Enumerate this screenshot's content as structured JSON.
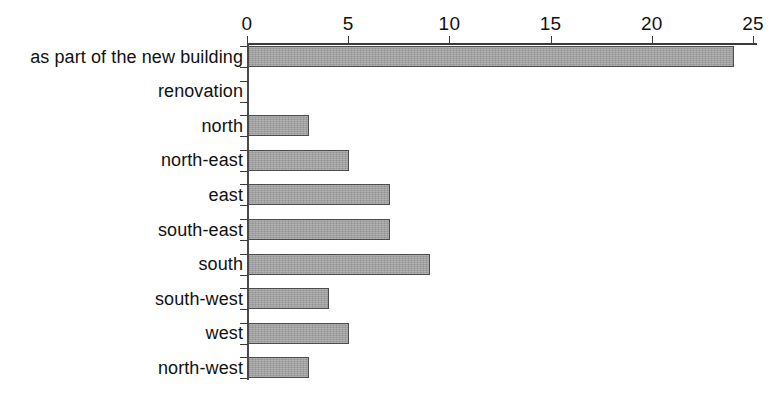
{
  "chart_data": {
    "type": "bar",
    "orientation": "horizontal",
    "title": "",
    "subtitle": "",
    "xlabel": "",
    "ylabel": "",
    "xlim": [
      0,
      25
    ],
    "xticks": [
      0,
      5,
      10,
      15,
      20,
      25
    ],
    "xtick_labels": [
      "0",
      "5",
      "10",
      "15",
      "20",
      "25"
    ],
    "grid": false,
    "legend": null,
    "bar_color": "#9a9a9a",
    "bar_edge_color": "#4c4c4c",
    "axis_color": "#3a3a3a",
    "categories": [
      "as part of the new building",
      "renovation",
      "north",
      "north-east",
      "east",
      "south-east",
      "south",
      "south-west",
      "west",
      "north-west"
    ],
    "values": [
      24,
      0,
      3,
      5,
      7,
      7,
      9,
      4,
      5,
      3
    ],
    "series": [
      {
        "name": "count",
        "values": [
          24,
          0,
          3,
          5,
          7,
          7,
          9,
          4,
          5,
          3
        ]
      }
    ]
  },
  "caption": {
    "fragment": ""
  }
}
